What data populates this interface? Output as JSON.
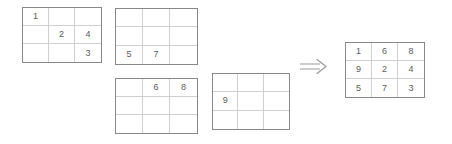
{
  "figure": {
    "type": "grid-merge-diagram",
    "colors": {
      "background": "#ffffff",
      "grid_outer_border": "#888888",
      "grid_inner_line": "#cfcfcf",
      "digit_text": "#5a5a5a",
      "arrow": "#9a9a9a"
    }
  },
  "operator": {
    "name": "double-right-arrow",
    "glyph": "⟹"
  },
  "grids": [
    {
      "id": "input-1",
      "name": "input-grid-1",
      "rows": [
        [
          "1",
          "",
          ""
        ],
        [
          "",
          "2",
          "4"
        ],
        [
          "",
          "",
          "3"
        ]
      ]
    },
    {
      "id": "input-2",
      "name": "input-grid-2",
      "rows": [
        [
          "",
          "",
          ""
        ],
        [
          "",
          "",
          ""
        ],
        [
          "5",
          "7",
          ""
        ]
      ]
    },
    {
      "id": "input-3",
      "name": "input-grid-3",
      "rows": [
        [
          "",
          "6",
          "8"
        ],
        [
          "",
          "",
          ""
        ],
        [
          "",
          "",
          ""
        ]
      ]
    },
    {
      "id": "input-4",
      "name": "input-grid-4",
      "rows": [
        [
          "",
          "",
          ""
        ],
        [
          "9",
          "",
          ""
        ],
        [
          "",
          "",
          ""
        ]
      ]
    },
    {
      "id": "result",
      "name": "result-grid",
      "rows": [
        [
          "1",
          "6",
          "8"
        ],
        [
          "9",
          "2",
          "4"
        ],
        [
          "5",
          "7",
          "3"
        ]
      ]
    }
  ]
}
